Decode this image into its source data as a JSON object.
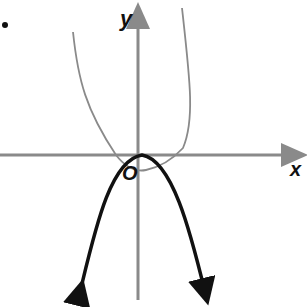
{
  "diagram": {
    "type": "coordinate-graph",
    "axes": {
      "x_label": "x",
      "y_label": "y",
      "origin_label": "O",
      "axis_color": "#8a8a8a"
    },
    "curves": [
      {
        "name": "gray-parabola",
        "description": "upward-opening parabola, vertex below x-axis slightly right of origin",
        "color": "#8a8a8a"
      },
      {
        "name": "black-parabola",
        "description": "downward-opening parabola, vertex at origin touching x-axis, arrowheads at both ends",
        "color": "#111111"
      }
    ],
    "bullet_marker": "."
  }
}
